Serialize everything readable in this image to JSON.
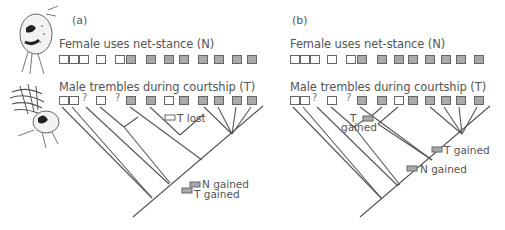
{
  "figure": {
    "panels": [
      {
        "label": "(a)",
        "female_row": {
          "title": "Female uses net-stance (N)",
          "states": [
            "absent",
            "absent",
            "absent",
            "absent",
            "absent",
            "present",
            "present",
            "present",
            "present",
            "present",
            "present",
            "present",
            "present"
          ]
        },
        "male_row": {
          "title": "Male trembles during courtship (T)",
          "states": [
            "absent",
            "absent",
            "unknown",
            "absent",
            "unknown",
            "present",
            "present",
            "absent",
            "present",
            "present",
            "present",
            "present",
            "present"
          ],
          "unknown_symbol": "?"
        },
        "annotations": [
          {
            "text": "T lost",
            "marker": "absent"
          },
          {
            "text": "N gained",
            "marker": "present"
          },
          {
            "text": "T gained",
            "marker": "present"
          }
        ]
      },
      {
        "label": "(b)",
        "female_row": {
          "title": "Female uses net-stance (N)",
          "states": [
            "absent",
            "absent",
            "absent",
            "absent",
            "absent",
            "present",
            "present",
            "present",
            "present",
            "present",
            "present",
            "present",
            "present"
          ]
        },
        "male_row": {
          "title": "Male trembles during courtship (T)",
          "states": [
            "absent",
            "absent",
            "unknown",
            "absent",
            "unknown",
            "present",
            "present",
            "absent",
            "present",
            "present",
            "present",
            "present",
            "present"
          ],
          "unknown_symbol": "?"
        },
        "annotations": [
          {
            "text": "T",
            "text2": "gained",
            "marker": "present"
          },
          {
            "text": "T gained",
            "marker": "present"
          },
          {
            "text": "N gained",
            "marker": "present"
          }
        ]
      }
    ],
    "illustrations": [
      "female-spider-illustration",
      "male-spider-trembling-illustration"
    ],
    "colors": {
      "present": "#a9a9a9",
      "absent": "#ffffff",
      "line": "#555555"
    }
  }
}
